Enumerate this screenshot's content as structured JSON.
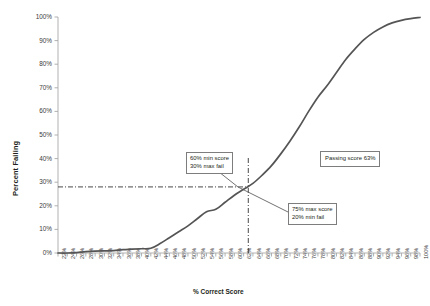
{
  "chart_data": {
    "type": "line",
    "title": "",
    "xlabel": "% Correct Score",
    "ylabel": "Percent Failing",
    "xlim": [
      22,
      100
    ],
    "ylim": [
      0,
      100
    ],
    "grid": false,
    "legend": "none",
    "series_name": "Percent Failing ogive",
    "x": [
      22,
      24,
      26,
      28,
      30,
      32,
      34,
      36,
      38,
      40,
      42,
      44,
      46,
      48,
      50,
      52,
      54,
      56,
      58,
      60,
      62,
      64,
      66,
      68,
      70,
      72,
      74,
      76,
      78,
      80,
      82,
      84,
      86,
      88,
      90,
      92,
      94,
      96,
      98,
      100
    ],
    "values": [
      0,
      0,
      0.2,
      0.6,
      0.8,
      0.9,
      1.0,
      1.4,
      1.6,
      1.8,
      2.0,
      4.0,
      6.5,
      9.0,
      11.5,
      14.5,
      17.5,
      18.5,
      21.5,
      24.5,
      27.0,
      29.5,
      33.0,
      37.0,
      42.0,
      47.5,
      53.5,
      60.0,
      66.0,
      71.0,
      76.5,
      82.0,
      86.5,
      90.5,
      93.5,
      95.8,
      97.5,
      98.6,
      99.3,
      99.8
    ],
    "x_tick_labels": [
      "22%",
      "24%",
      "26%",
      "28%",
      "30%",
      "32%",
      "34%",
      "36%",
      "38%",
      "40%",
      "42%",
      "44%",
      "46%",
      "48%",
      "50%",
      "52%",
      "54%",
      "56%",
      "58%",
      "60%",
      "62%",
      "64%",
      "66%",
      "68%",
      "70%",
      "72%",
      "74%",
      "76%",
      "78%",
      "80%",
      "82%",
      "84%",
      "86%",
      "88%",
      "90%",
      "92%",
      "94%",
      "96%",
      "98%",
      "100%"
    ],
    "y_tick_labels": [
      "0%",
      "10%",
      "20%",
      "30%",
      "40%",
      "50%",
      "60%",
      "70%",
      "80%",
      "90%",
      "100%"
    ],
    "y_tick_values": [
      0,
      10,
      20,
      30,
      40,
      50,
      60,
      70,
      80,
      90,
      100
    ],
    "reference_lines": [
      {
        "name": "passing-score-vertical",
        "orientation": "vertical",
        "value": 63,
        "style": "dash-dot"
      },
      {
        "name": "max-fail-horizontal",
        "orientation": "horizontal",
        "value": 28,
        "style": "dash-dot"
      }
    ],
    "annotations": [
      {
        "id": "min-score-box",
        "line1": "60% min score",
        "line2": "30% max fail"
      },
      {
        "id": "max-score-box",
        "line1": "75% max score",
        "line2": "20% min fail"
      },
      {
        "id": "passing-score-box",
        "line1": "Passing score 63%",
        "line2": ""
      }
    ],
    "colors": {
      "line": "#555555",
      "axis": "#a8a8a8",
      "text": "#231f20",
      "annotation_border": "#7d7d7d"
    }
  },
  "axis": {
    "y_title": "Percent Failing",
    "x_title": "% Correct Score"
  },
  "annotations": {
    "min_score": {
      "line1": "60% min score",
      "line2": "30% max fail"
    },
    "max_score": {
      "line1": "75% max score",
      "line2": "20% min fail"
    },
    "passing": {
      "text": "Passing score 63%"
    }
  }
}
